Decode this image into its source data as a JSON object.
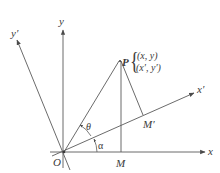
{
  "diagram": {
    "type": "coordinate-rotation",
    "axes": {
      "x": "x",
      "y": "y",
      "x_prime": "x′",
      "y_prime": "y′"
    },
    "points": {
      "origin": "O",
      "P": "P",
      "M": "M",
      "M_prime": "M′"
    },
    "point_P_coords": {
      "original": "(x, y)",
      "rotated": "(x′, y′)"
    },
    "angles": {
      "theta": "θ",
      "alpha": "α"
    },
    "colors": {
      "line": "#5a5a5a",
      "text": "#3a3a3a",
      "background": "#ffffff"
    }
  }
}
